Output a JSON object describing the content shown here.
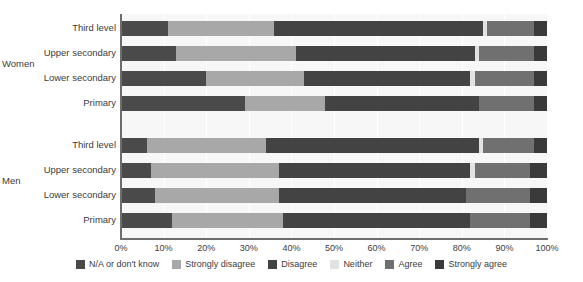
{
  "chart_data": {
    "type": "bar",
    "orientation": "horizontal",
    "stacked": true,
    "stack_mode": "percent",
    "title": "",
    "subtitle": "",
    "xlabel": "",
    "ylabel": "",
    "xlim": [
      0,
      100
    ],
    "xticks": [
      "0%",
      "10%",
      "20%",
      "30%",
      "40%",
      "50%",
      "60%",
      "70%",
      "80%",
      "90%",
      "100%"
    ],
    "xtick_values": [
      0,
      10,
      20,
      30,
      40,
      50,
      60,
      70,
      80,
      90,
      100
    ],
    "grid": true,
    "grid_axis": "x",
    "legend_position": "bottom",
    "legend": [
      "N/A or don't know",
      "Strongly disagree",
      "Disagree",
      "Neither",
      "Agree",
      "Strongly agree"
    ],
    "colors": {
      "N/A or don't know": "#4a4a4a",
      "Strongly disagree": "#a8a8a8",
      "Disagree": "#434343",
      "Neither": "#e2e2e2",
      "Agree": "#707070",
      "Strongly agree": "#3a3a3a",
      "plot_background": "#f7f7f7",
      "gridline": "#ffffff",
      "axis": "#6d6d6d",
      "text": "#3c3c3c",
      "page_background": "#ffffff"
    },
    "series": [
      {
        "name": "N/A or don't know",
        "key": "na"
      },
      {
        "name": "Strongly disagree",
        "key": "strongly_disagree"
      },
      {
        "name": "Disagree",
        "key": "disagree"
      },
      {
        "name": "Neither",
        "key": "neither"
      },
      {
        "name": "Agree",
        "key": "agree"
      },
      {
        "name": "Strongly agree",
        "key": "strongly_agree"
      }
    ],
    "groups": [
      {
        "label": "Women",
        "categories": [
          "Third level",
          "Upper secondary",
          "Lower secondary",
          "Primary"
        ],
        "rows": [
          {
            "category": "Third level",
            "values": [
              11,
              25,
              49,
              1,
              11,
              3
            ]
          },
          {
            "category": "Upper secondary",
            "values": [
              13,
              28,
              42,
              1,
              13,
              3
            ]
          },
          {
            "category": "Lower secondary",
            "values": [
              20,
              23,
              39,
              1,
              14,
              3
            ]
          },
          {
            "category": "Primary",
            "values": [
              29,
              19,
              36,
              0,
              13,
              3
            ]
          }
        ]
      },
      {
        "label": "Men",
        "categories": [
          "Third level",
          "Upper secondary",
          "Lower secondary",
          "Primary"
        ],
        "rows": [
          {
            "category": "Third level",
            "values": [
              6,
              28,
              50,
              1,
              12,
              3
            ]
          },
          {
            "category": "Upper secondary",
            "values": [
              7,
              30,
              45,
              1,
              13,
              4
            ]
          },
          {
            "category": "Lower secondary",
            "values": [
              8,
              29,
              44,
              0,
              15,
              4
            ]
          },
          {
            "category": "Primary",
            "values": [
              12,
              26,
              44,
              0,
              14,
              4
            ]
          }
        ]
      }
    ]
  },
  "axis": {
    "ticks": [
      {
        "label": "0%",
        "value": 0
      },
      {
        "label": "10%",
        "value": 10
      },
      {
        "label": "20%",
        "value": 20
      },
      {
        "label": "30%",
        "value": 30
      },
      {
        "label": "40%",
        "value": 40
      },
      {
        "label": "50%",
        "value": 50
      },
      {
        "label": "60%",
        "value": 60
      },
      {
        "label": "70%",
        "value": 70
      },
      {
        "label": "80%",
        "value": 80
      },
      {
        "label": "90%",
        "value": 90
      },
      {
        "label": "100%",
        "value": 100
      }
    ]
  },
  "labels": {
    "women_group": "Women",
    "men_group": "Men",
    "women_third_level": "Third level",
    "women_upper_secondary": "Upper secondary",
    "women_lower_secondary": "Lower secondary",
    "women_primary": "Primary",
    "men_third_level": "Third level",
    "men_upper_secondary": "Upper secondary",
    "men_lower_secondary": "Lower secondary",
    "men_primary": "Primary"
  },
  "legend": {
    "items": [
      {
        "label": "N/A or don't know",
        "color": "#4a4a4a",
        "icon": "legend-swatch-icon"
      },
      {
        "label": "Strongly disagree",
        "color": "#a8a8a8",
        "icon": "legend-swatch-icon"
      },
      {
        "label": "Disagree",
        "color": "#434343",
        "icon": "legend-swatch-icon"
      },
      {
        "label": "Neither",
        "color": "#e2e2e2",
        "icon": "legend-swatch-icon"
      },
      {
        "label": "Agree",
        "color": "#707070",
        "icon": "legend-swatch-icon"
      },
      {
        "label": "Strongly agree",
        "color": "#3a3a3a",
        "icon": "legend-swatch-icon"
      }
    ]
  }
}
